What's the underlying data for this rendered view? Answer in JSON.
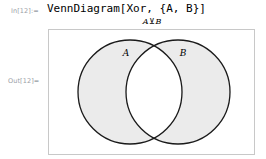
{
  "notebook": {
    "input_label": "In[12]:=",
    "output_label": "Out[12]=",
    "input_code": "VennDiagram[Xor, {A, B}]"
  },
  "graphic": {
    "title": {
      "left_operand": "A",
      "operator": "⊻",
      "right_operand": "B"
    },
    "frame": {
      "border_color": "#c8c8c8",
      "background_color": "#ffffff"
    },
    "venn": {
      "type": "venn-diagram",
      "operation": "Xor",
      "sets": [
        {
          "name": "A",
          "label": "A",
          "shaded": true
        },
        {
          "name": "B",
          "label": "B",
          "shaded": true
        }
      ],
      "intersection_shaded": false,
      "fill_color": "#ebebeb",
      "stroke_color": "#1a1a1a",
      "intersection_color": "#ffffff"
    }
  }
}
